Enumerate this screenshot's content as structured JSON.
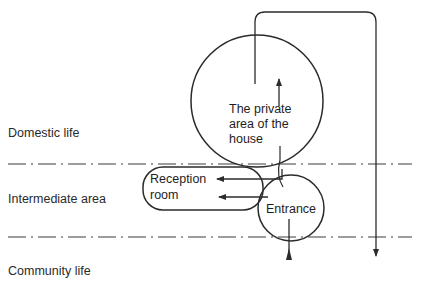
{
  "zones": [
    {
      "id": "domestic",
      "label": "Domestic life"
    },
    {
      "id": "intermediate",
      "label": "Intermediate area"
    },
    {
      "id": "community",
      "label": "Community life"
    }
  ],
  "nodes": {
    "private_area": {
      "line1": "The private",
      "line2": "area of the",
      "line3": "house"
    },
    "reception": {
      "line1": "Reception",
      "line2": "room"
    },
    "entrance": {
      "label": "Entrance"
    }
  },
  "colors": {
    "stroke": "#2b2b2b",
    "background": "#ffffff",
    "text": "#2a2a2a"
  }
}
